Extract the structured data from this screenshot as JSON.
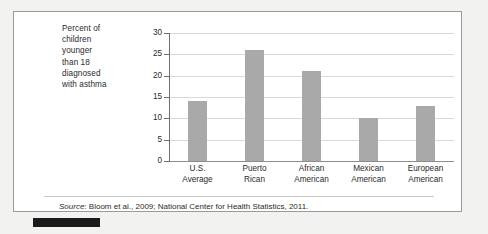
{
  "figure": {
    "y_axis_caption_lines": [
      "Percent of",
      "children",
      "younger",
      "than 18",
      "diagnosed",
      "with asthma"
    ],
    "source_label": "Source",
    "source_separator": ": ",
    "source_text": "Bloom et al., 2009; National Center for Health Statistics, 2011.",
    "bar_color": "#a9a9a9",
    "gridline_color": "#d8d8d8",
    "axis_color": "#6f6f6f",
    "frame_color": "#9a9a9a",
    "background_color": "#f2f2f1",
    "panel_color": "#ffffff"
  },
  "chart_data": {
    "type": "bar",
    "title": "",
    "xlabel": "",
    "ylabel": "Percent of children younger than 18 diagnosed with asthma",
    "categories": [
      "U.S. Average",
      "Puerto Rican",
      "African American",
      "Mexican American",
      "European American"
    ],
    "category_lines": [
      [
        "U.S.",
        "Average"
      ],
      [
        "Puerto",
        "Rican"
      ],
      [
        "African",
        "American"
      ],
      [
        "Mexican",
        "American"
      ],
      [
        "European",
        "American"
      ]
    ],
    "values": [
      14,
      26,
      21,
      10,
      13
    ],
    "ylim": [
      0,
      30
    ],
    "yticks": [
      0,
      5,
      10,
      15,
      20,
      25,
      30
    ],
    "ytick_labels": [
      "0",
      "5",
      "10",
      "15",
      "20",
      "25",
      "30"
    ],
    "grid": true,
    "legend": "none",
    "source": "Source: Bloom et al., 2009; National Center for Health Statistics, 2011."
  }
}
